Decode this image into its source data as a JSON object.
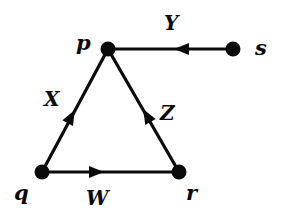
{
  "diagram": {
    "type": "directed-graph",
    "colors": {
      "stroke": "#0a0a0a",
      "background": "#ffffff"
    },
    "nodes": [
      {
        "id": "p",
        "label": "p"
      },
      {
        "id": "q",
        "label": "q"
      },
      {
        "id": "r",
        "label": "r"
      },
      {
        "id": "s",
        "label": "s"
      }
    ],
    "edges": [
      {
        "id": "X",
        "label": "X",
        "from": "q",
        "to": "p"
      },
      {
        "id": "Y",
        "label": "Y",
        "from": "s",
        "to": "p"
      },
      {
        "id": "Z",
        "label": "Z",
        "from": "r",
        "to": "p"
      },
      {
        "id": "W",
        "label": "W",
        "from": "q",
        "to": "r"
      }
    ]
  }
}
